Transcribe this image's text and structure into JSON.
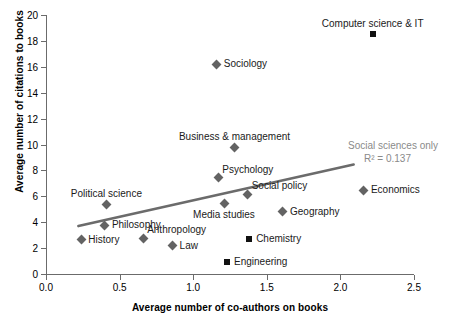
{
  "chart_data": {
    "type": "scatter",
    "title": "",
    "xlabel": "Average number of co-authors on books",
    "ylabel": "Average number of citations to books",
    "xlim": [
      0.0,
      2.5
    ],
    "ylim": [
      0,
      20
    ],
    "xticks": [
      "0.0",
      "0.5",
      "1.0",
      "1.5",
      "2.0",
      "2.5"
    ],
    "yticks": [
      "0",
      "2",
      "4",
      "6",
      "8",
      "10",
      "12",
      "14",
      "16",
      "18",
      "20"
    ],
    "grid": false,
    "legend": "none",
    "series": [
      {
        "name": "Social sciences",
        "marker": "diamond",
        "color": "#636363",
        "points": [
          {
            "label": "Sociology",
            "x": 1.16,
            "y": 16.2,
            "label_pos": "right"
          },
          {
            "label": "Business & management",
            "x": 1.28,
            "y": 9.8,
            "label_pos": "above"
          },
          {
            "label": "Psychology",
            "x": 1.17,
            "y": 7.45,
            "label_pos": "above-right"
          },
          {
            "label": "Economics",
            "x": 2.16,
            "y": 6.45,
            "label_pos": "right"
          },
          {
            "label": "Social policy",
            "x": 1.37,
            "y": 6.15,
            "label_pos": "above-right"
          },
          {
            "label": "Political science",
            "x": 0.41,
            "y": 5.4,
            "label_pos": "above"
          },
          {
            "label": "Media studies",
            "x": 1.21,
            "y": 5.45,
            "label_pos": "below"
          },
          {
            "label": "Geography",
            "x": 1.61,
            "y": 4.8,
            "label_pos": "right"
          },
          {
            "label": "Philosophy",
            "x": 0.4,
            "y": 3.75,
            "label_pos": "right"
          },
          {
            "label": "Anthropology",
            "x": 0.66,
            "y": 2.75,
            "label_pos": "above-right"
          },
          {
            "label": "History",
            "x": 0.24,
            "y": 2.65,
            "label_pos": "right"
          },
          {
            "label": "Law",
            "x": 0.86,
            "y": 2.2,
            "label_pos": "right"
          }
        ]
      },
      {
        "name": "Other disciplines",
        "marker": "square",
        "color": "#111111",
        "points": [
          {
            "label": "Computer science & IT",
            "x": 2.22,
            "y": 18.5,
            "label_pos": "above"
          },
          {
            "label": "Chemistry",
            "x": 1.38,
            "y": 2.7,
            "label_pos": "right"
          },
          {
            "label": "Engineering",
            "x": 1.23,
            "y": 0.95,
            "label_pos": "right"
          }
        ]
      }
    ],
    "trendline": {
      "name": "Social sciences only",
      "color": "#6b6b6b",
      "x_start": 0.22,
      "y_start": 3.7,
      "x_end": 2.09,
      "y_end": 8.45,
      "annotation_title": "Social sciences only",
      "annotation_r2": "R² = 0.137"
    }
  }
}
